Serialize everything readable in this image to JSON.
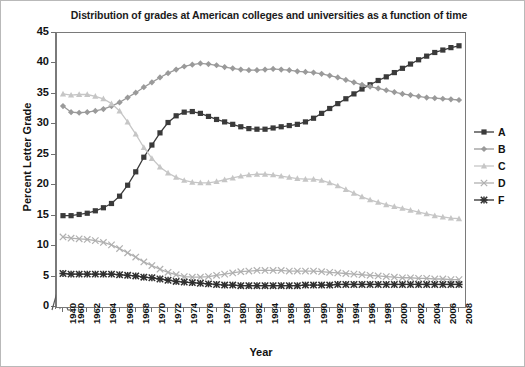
{
  "chart_data": {
    "type": "line",
    "title": "Distribution of grades at American colleges and universities as a function of time",
    "xlabel": "Year",
    "ylabel": "Percent Letter Grade",
    "ylim": [
      0,
      45
    ],
    "yticks": [
      0,
      5,
      10,
      15,
      20,
      25,
      30,
      35,
      40,
      45
    ],
    "grid": false,
    "legend_position": "right",
    "axis_break": "x-axis break between 1940 and 1960",
    "categories": [
      1940,
      1960,
      1961,
      1962,
      1963,
      1964,
      1965,
      1966,
      1967,
      1968,
      1969,
      1970,
      1971,
      1972,
      1973,
      1974,
      1975,
      1976,
      1977,
      1978,
      1979,
      1980,
      1981,
      1982,
      1983,
      1984,
      1985,
      1986,
      1987,
      1988,
      1989,
      1990,
      1991,
      1992,
      1993,
      1994,
      1995,
      1996,
      1997,
      1998,
      1999,
      2000,
      2001,
      2002,
      2003,
      2004,
      2005,
      2006,
      2007,
      2008
    ],
    "xtick_labels": [
      "1940",
      "1960",
      "1962",
      "1964",
      "1966",
      "1968",
      "1970",
      "1972",
      "1974",
      "1976",
      "1978",
      "1980",
      "1982",
      "1984",
      "1986",
      "1988",
      "1990",
      "1992",
      "1994",
      "1996",
      "1998",
      "2000",
      "2002",
      "2004",
      "2006",
      "2008"
    ],
    "series": [
      {
        "name": "A",
        "marker": "square",
        "color": "#3a3a3a",
        "values": [
          15.0,
          15.0,
          15.2,
          15.4,
          15.8,
          16.3,
          17.0,
          18.2,
          20.0,
          22.2,
          24.6,
          26.6,
          28.6,
          30.3,
          31.4,
          32.0,
          32.1,
          31.8,
          31.3,
          30.8,
          30.4,
          30.0,
          29.6,
          29.3,
          29.2,
          29.2,
          29.4,
          29.6,
          29.8,
          30.0,
          30.4,
          31.0,
          31.8,
          32.6,
          33.4,
          34.2,
          35.0,
          35.8,
          36.5,
          37.2,
          37.8,
          38.5,
          39.2,
          39.9,
          40.6,
          41.2,
          41.8,
          42.2,
          42.6,
          42.9
        ]
      },
      {
        "name": "B",
        "marker": "diamond",
        "color": "#9a9a9a",
        "values": [
          33.0,
          32.0,
          31.9,
          32.0,
          32.2,
          32.5,
          33.0,
          33.6,
          34.4,
          35.2,
          36.1,
          36.9,
          37.7,
          38.4,
          39.0,
          39.5,
          39.8,
          40.0,
          39.9,
          39.7,
          39.4,
          39.2,
          39.0,
          38.9,
          38.9,
          39.0,
          39.1,
          39.0,
          38.9,
          38.7,
          38.6,
          38.5,
          38.3,
          38.0,
          37.7,
          37.3,
          36.9,
          36.5,
          36.2,
          35.9,
          35.6,
          35.3,
          35.0,
          34.8,
          34.6,
          34.4,
          34.3,
          34.2,
          34.1,
          34.0
        ]
      },
      {
        "name": "C",
        "marker": "triangle",
        "color": "#c6c6c6",
        "values": [
          35.0,
          34.8,
          34.9,
          34.9,
          34.6,
          34.2,
          33.4,
          32.2,
          30.4,
          28.4,
          26.2,
          24.4,
          23.0,
          22.0,
          21.3,
          20.8,
          20.5,
          20.4,
          20.4,
          20.6,
          20.9,
          21.2,
          21.5,
          21.7,
          21.8,
          21.8,
          21.7,
          21.5,
          21.3,
          21.1,
          21.0,
          21.0,
          20.8,
          20.4,
          19.9,
          19.3,
          18.7,
          18.1,
          17.6,
          17.2,
          16.8,
          16.5,
          16.2,
          15.9,
          15.6,
          15.3,
          15.0,
          14.8,
          14.6,
          14.5
        ]
      },
      {
        "name": "D",
        "marker": "x-light",
        "color": "#b0b0b0",
        "values": [
          11.5,
          11.3,
          11.2,
          11.1,
          10.9,
          10.6,
          10.2,
          9.6,
          8.9,
          8.2,
          7.4,
          6.8,
          6.2,
          5.7,
          5.3,
          5.0,
          4.9,
          4.9,
          5.0,
          5.2,
          5.4,
          5.6,
          5.8,
          5.9,
          6.0,
          6.0,
          6.0,
          6.0,
          5.9,
          5.9,
          5.9,
          5.9,
          5.8,
          5.7,
          5.6,
          5.5,
          5.4,
          5.3,
          5.2,
          5.1,
          5.0,
          4.9,
          4.8,
          4.8,
          4.7,
          4.7,
          4.6,
          4.6,
          4.5,
          4.5
        ]
      },
      {
        "name": "F",
        "marker": "star",
        "color": "#2f2f2f",
        "values": [
          5.5,
          5.4,
          5.4,
          5.4,
          5.4,
          5.4,
          5.4,
          5.3,
          5.2,
          5.1,
          4.9,
          4.8,
          4.6,
          4.4,
          4.2,
          4.1,
          4.0,
          3.9,
          3.8,
          3.7,
          3.6,
          3.6,
          3.5,
          3.5,
          3.5,
          3.5,
          3.5,
          3.5,
          3.5,
          3.5,
          3.6,
          3.6,
          3.6,
          3.6,
          3.7,
          3.7,
          3.7,
          3.7,
          3.7,
          3.7,
          3.7,
          3.7,
          3.7,
          3.7,
          3.7,
          3.7,
          3.7,
          3.7,
          3.7,
          3.7
        ]
      }
    ]
  },
  "legend": {
    "items": [
      {
        "label": "A"
      },
      {
        "label": "B"
      },
      {
        "label": "C"
      },
      {
        "label": "D"
      },
      {
        "label": "F"
      }
    ]
  }
}
